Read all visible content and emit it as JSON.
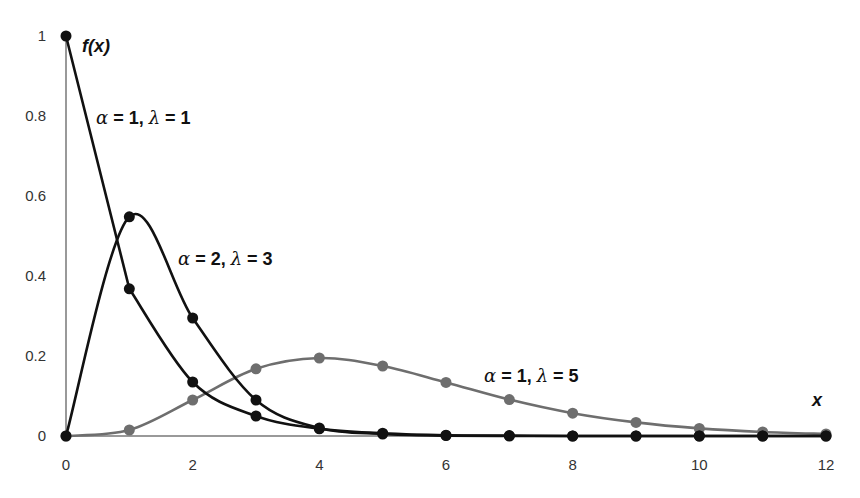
{
  "chart_data": {
    "type": "line",
    "title": "",
    "xlabel": "x",
    "ylabel": "f(x)",
    "xlim": [
      0,
      12
    ],
    "ylim": [
      0,
      1
    ],
    "grid": false,
    "legend": "inline annotations",
    "x_ticks": [
      "0",
      "2",
      "4",
      "6",
      "8",
      "10",
      "12"
    ],
    "y_ticks": [
      "0",
      "0.2",
      "0.4",
      "0.6",
      "0.8",
      "1"
    ],
    "x": [
      0,
      1,
      2,
      3,
      4,
      5,
      6,
      7,
      8,
      9,
      10,
      11,
      12
    ],
    "series": [
      {
        "name": "α = 1, λ = 1",
        "color": "#111111",
        "values": [
          1.0,
          0.368,
          0.135,
          0.05,
          0.018,
          0.007,
          0.002,
          0.001,
          0.0,
          0.0,
          0.0,
          0.0,
          0.0
        ]
      },
      {
        "name": "α = 2, λ = 3",
        "color": "#111111",
        "values": [
          0.0,
          0.548,
          0.295,
          0.09,
          0.02,
          0.005,
          0.001,
          0.0,
          0.0,
          0.0,
          0.0,
          0.0,
          0.0
        ]
      },
      {
        "name": "α = 1, λ = 5",
        "color": "#6e6e6e",
        "values": [
          0.0,
          0.015,
          0.09,
          0.168,
          0.195,
          0.175,
          0.134,
          0.091,
          0.057,
          0.034,
          0.019,
          0.01,
          0.005
        ]
      }
    ],
    "annotations": [
      {
        "series": 0,
        "alpha": "1",
        "lambda": "1"
      },
      {
        "series": 1,
        "alpha": "2",
        "lambda": "3"
      },
      {
        "series": 2,
        "alpha": "1",
        "lambda": "5"
      }
    ]
  },
  "labels": {
    "y_axis": "f(x)",
    "x_axis": "x",
    "s0": {
      "alpha": "α",
      "eq1": " = 1, ",
      "lambda": "λ",
      "eq2": " = 1"
    },
    "s1": {
      "alpha": "α",
      "eq1": " = 2, ",
      "lambda": "λ",
      "eq2": " = 3"
    },
    "s2": {
      "alpha": "α",
      "eq1": " = 1, ",
      "lambda": "λ",
      "eq2": " = 5"
    }
  }
}
